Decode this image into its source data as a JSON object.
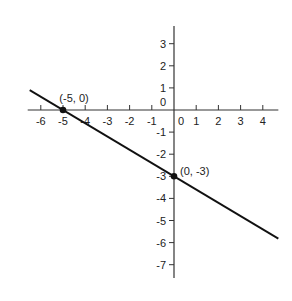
{
  "chart_data": {
    "type": "line",
    "title": "",
    "xlabel": "",
    "ylabel": "",
    "xlim": [
      -6.5,
      4.7
    ],
    "ylim": [
      -7.6,
      3.8
    ],
    "grid": false,
    "x_ticks": [
      -6,
      -5,
      -4,
      -3,
      -2,
      -1,
      0,
      1,
      2,
      3,
      4
    ],
    "x_tick_labels": [
      "-6",
      "-5",
      "-4",
      "-3",
      "-2",
      "-1",
      "0",
      "1",
      "2",
      "3",
      "4"
    ],
    "y_ticks": [
      3,
      2,
      1,
      0,
      -1,
      -2,
      -3,
      -4,
      -5,
      -6,
      -7
    ],
    "y_tick_labels": [
      "3",
      "2",
      "1",
      "0",
      "-1",
      "-2",
      "-3",
      "-4",
      "-5",
      "-6",
      "-7"
    ],
    "series": [
      {
        "name": "line through (-5, 0) and (0, -3)",
        "equation": "y = -0.6x - 3",
        "x": [
          -6.5,
          4.7
        ],
        "y": [
          0.9,
          -5.82
        ],
        "color": "#111111"
      }
    ],
    "points": [
      {
        "x": -5,
        "y": 0,
        "label": "(-5, 0)"
      },
      {
        "x": 0,
        "y": -3,
        "label": "(0, -3)"
      }
    ]
  }
}
